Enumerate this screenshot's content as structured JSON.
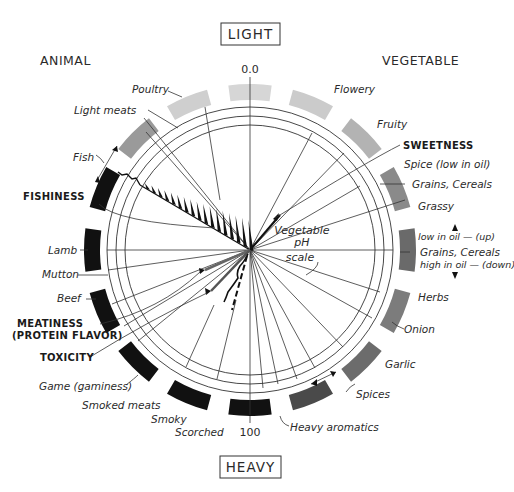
{
  "title_top": "LIGHT",
  "title_bottom": "HEAVY",
  "side_left": "ANIMAL",
  "side_right": "VEGETABLE",
  "scale_top": "0.0",
  "scale_bottom": "100",
  "center_label": [
    "Vegetable",
    "pH",
    "scale"
  ],
  "categories_bold": {
    "fishiness": "FISHINESS",
    "meatiness_1": "MEATINESS",
    "meatiness_2": "(PROTEIN FLAVOR)",
    "toxicity": "TOXICITY",
    "sweetness": "SWEETNESS"
  },
  "labels": {
    "poultry": "Poultry",
    "light_meats": "Light  meats",
    "fish": "Fish",
    "lamb": "Lamb",
    "mutton": "Mutton",
    "beef": "Beef",
    "game": "Game (gaminess)",
    "smoked_meats": "Smoked meats",
    "smoky": "Smoky",
    "scorched": "Scorched",
    "heavy_aromatics": "Heavy aromatics",
    "spices": "Spices",
    "garlic": "Garlic",
    "onion": "Onion",
    "herbs": "Herbs",
    "grains_low": "low in oil — (up)",
    "grains_oil": "Grains, Cereals",
    "grains_high": "high in oil — (down)",
    "grassy": "Grassy",
    "grains_cereals": "Grains, Cereals",
    "spice_low_oil": "Spice (low in oil)",
    "fruity": "Fruity",
    "flowery": "Flowery"
  },
  "blocks": [
    {
      "name": "light",
      "angle": 0,
      "color": "#d6d6d6"
    },
    {
      "name": "flowery",
      "angle": 22.5,
      "color": "#cbcbcb"
    },
    {
      "name": "fruity",
      "angle": 45,
      "color": "#b3b3b3"
    },
    {
      "name": "grains-cereals",
      "angle": 67.5,
      "color": "#8a8a8a"
    },
    {
      "name": "grains-oil",
      "angle": 90,
      "color": "#6a6a6a"
    },
    {
      "name": "herbs-onion",
      "angle": 112.5,
      "color": "#7c7c7c"
    },
    {
      "name": "garlic",
      "angle": 135,
      "color": "#6c6c6c"
    },
    {
      "name": "spices",
      "angle": 157.5,
      "color": "#4a4a4a"
    },
    {
      "name": "heavy",
      "angle": 180,
      "color": "#111111"
    },
    {
      "name": "smoky",
      "angle": 202.5,
      "color": "#111111"
    },
    {
      "name": "game",
      "angle": 225,
      "color": "#111111"
    },
    {
      "name": "beef",
      "angle": 247.5,
      "color": "#111111"
    },
    {
      "name": "lamb",
      "angle": 270,
      "color": "#111111"
    },
    {
      "name": "fish",
      "angle": 292.5,
      "color": "#111111"
    },
    {
      "name": "light-meats",
      "angle": 315,
      "color": "#9a9a9a"
    },
    {
      "name": "poultry",
      "angle": 337.5,
      "color": "#cfcfcf"
    }
  ]
}
